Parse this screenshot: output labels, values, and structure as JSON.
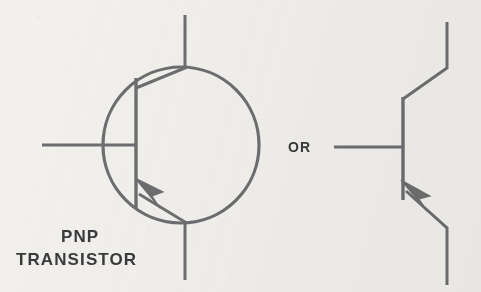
{
  "figure": {
    "background_color": "#f2f1ee",
    "line_color": "#6e6e70",
    "text_color": "#3a3a3c",
    "line_width": 3,
    "width": 481,
    "height": 292
  },
  "labels": {
    "device_line1": "PNP",
    "device_line2": "TRANSISTOR",
    "alternative": "OR"
  },
  "diagram_data": {
    "type": "schematic",
    "symbol_count": 2,
    "symbols": [
      {
        "name": "pnp-transistor-encapsulated",
        "style": "with-envelope-circle",
        "envelope": {
          "cx": 181,
          "cy": 145,
          "r": 78
        },
        "base_bar": {
          "x": 136,
          "y1": 78,
          "y2": 208
        },
        "base_lead": {
          "x1": 42,
          "y1": 145,
          "x2": 136,
          "y2": 145
        },
        "collector_lead": {
          "points": "136,88 185,68 185,15"
        },
        "emitter_lead": {
          "points": "136,195 185,222 185,280"
        },
        "emitter_arrow": {
          "direction": "toward-base",
          "polarity": "PNP",
          "tip_x": 140,
          "tip_y": 182
        }
      },
      {
        "name": "pnp-transistor-plain",
        "style": "no-envelope-circle",
        "base_bar": {
          "x": 403,
          "y1": 97,
          "y2": 200
        },
        "base_lead": {
          "x1": 334,
          "y1": 147,
          "x2": 403,
          "y2": 147
        },
        "collector_lead": {
          "points": "403,99 447,68 447,22"
        },
        "emitter_lead": {
          "points": "403,192 447,228 447,285"
        },
        "emitter_arrow": {
          "direction": "toward-base",
          "polarity": "PNP",
          "tip_x": 406,
          "tip_y": 184
        }
      }
    ],
    "terminals": [
      "collector",
      "base",
      "emitter"
    ],
    "annotations": [
      "PNP",
      "TRANSISTOR",
      "OR"
    ]
  }
}
